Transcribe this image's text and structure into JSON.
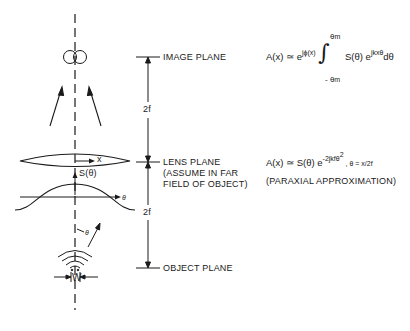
{
  "planes": {
    "image": "IMAGE PLANE",
    "lens": "LENS PLANE",
    "lens_note_1": "(ASSUME IN FAR",
    "lens_note_2": "FIELD OF OBJECT)",
    "object": "OBJECT PLANE"
  },
  "dimensions": {
    "upper": "2f",
    "lower": "2f",
    "width": "W"
  },
  "axis_labels": {
    "x": "x",
    "s_theta": "S(θ)",
    "theta_axis": "θ",
    "theta_angle": "θ"
  },
  "equations": {
    "eq1": {
      "lhs": "A(x) ≃ e",
      "exp1": "jϕ(x)",
      "upper_limit": "θ",
      "upper_sub": "m",
      "lower_limit": "- θ",
      "lower_sub": "m",
      "integrand": "S(θ) e",
      "exp2": "jkxθ",
      "diff": "dθ"
    },
    "eq2": {
      "lhs": "A(x) ≃ S(θ) e",
      "exp": "-2jkfθ",
      "exp_sq": "2",
      "rest": " ,  θ = x/2f"
    },
    "eq2_note": "(PARAXIAL APPROXIMATION)"
  },
  "colors": {
    "ink": "#1a1a1a",
    "background": "#ffffff"
  }
}
